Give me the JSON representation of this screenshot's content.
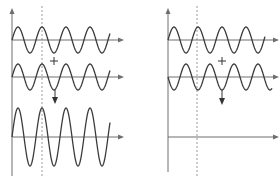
{
  "diagram": {
    "title": "",
    "colors": {
      "axis": "#6e6e6e",
      "wave": "#3c3c3c",
      "guide": "#9a9a9a",
      "symbol": "#333333"
    },
    "panels": [
      {
        "name": "constructive-interference",
        "y_axis_x": 12,
        "y_axis_top": 8,
        "y_axis_bottom": 176,
        "axis_end_x": 124,
        "guide_x": 42,
        "plus": {
          "x": 54,
          "y": 61
        },
        "arrow": {
          "x": 55,
          "y1": 90,
          "y2": 104
        },
        "waves": [
          {
            "role": "wave-1",
            "baseline": 40,
            "amplitude": 13,
            "x0": 12,
            "x1": 110,
            "period": 24,
            "phase": 0
          },
          {
            "role": "wave-2",
            "baseline": 77,
            "amplitude": 13,
            "x0": 12,
            "x1": 110,
            "period": 24,
            "phase": 0
          },
          {
            "role": "resultant",
            "baseline": 137,
            "amplitude": 29,
            "x0": 12,
            "x1": 110,
            "period": 24,
            "phase": 0
          }
        ]
      },
      {
        "name": "destructive-interference",
        "y_axis_x": 168,
        "y_axis_top": 8,
        "y_axis_bottom": 172,
        "axis_end_x": 279,
        "guide_x": 197,
        "plus": {
          "x": 222,
          "y": 61
        },
        "arrow": {
          "x": 222,
          "y1": 90,
          "y2": 105
        },
        "waves": [
          {
            "role": "wave-1",
            "baseline": 40,
            "amplitude": 13,
            "x0": 168,
            "x1": 265,
            "period": 24,
            "phase": 0
          },
          {
            "role": "wave-2",
            "baseline": 77,
            "amplitude": 13,
            "x0": 168,
            "x1": 272,
            "period": 24,
            "phase": 180
          },
          {
            "role": "resultant",
            "baseline": 137,
            "amplitude": 0,
            "x0": 168,
            "x1": 168,
            "period": 24,
            "phase": 0
          }
        ]
      }
    ]
  }
}
